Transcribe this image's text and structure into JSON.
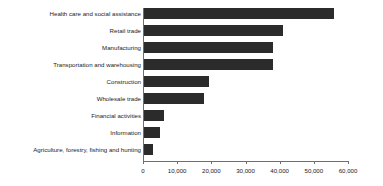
{
  "chart_data": {
    "type": "bar",
    "orientation": "horizontal",
    "title": "",
    "subtitle": "",
    "xlabel": "",
    "ylabel": "",
    "xlim": [
      0,
      60000
    ],
    "ylim": null,
    "grid": false,
    "legend": null,
    "legend_position": "none",
    "bar_color": "#2b2b2b",
    "axis_color": "#6f6f6f",
    "xticks": [
      0,
      10000,
      20000,
      30000,
      40000,
      50000,
      60000
    ],
    "xtick_labels": [
      "0",
      "10,000",
      "20,000",
      "30,000",
      "40,000",
      "50,000",
      "60,000"
    ],
    "categories": [
      "Health care and social assistance",
      "Retail trade",
      "Manufacturing",
      "Transportation and warehousing",
      "Construction",
      "Wholesale trade",
      "Financial activities",
      "Information",
      "Agriculture, forestry, fishing and hunting"
    ],
    "values": [
      56000,
      41000,
      38000,
      38000,
      19300,
      17800,
      6200,
      5000,
      2900
    ],
    "series": [
      {
        "name": "",
        "values": [
          56000,
          41000,
          38000,
          38000,
          19300,
          17800,
          6200,
          5000,
          2900
        ]
      }
    ],
    "annotations": []
  }
}
